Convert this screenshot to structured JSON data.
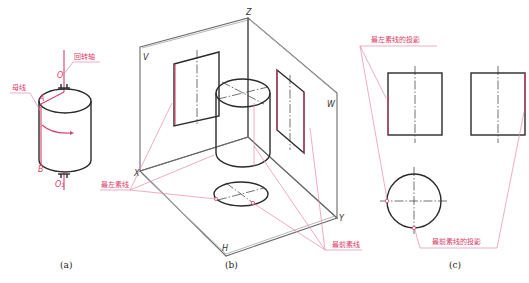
{
  "figure_a": {
    "caption": "(a)",
    "labels": {
      "rotation_axis": "回转轴",
      "generatrix": "母线"
    },
    "points": {
      "O_top": "O",
      "A": "A",
      "B": "B",
      "O1_bottom": "O₁"
    }
  },
  "figure_b": {
    "caption": "(b)",
    "axes": {
      "Z": "Z",
      "X": "X",
      "Y": "Y"
    },
    "planes": {
      "V": "V",
      "W": "W",
      "H": "H"
    },
    "labels": {
      "leftmost_element": "最左素线",
      "frontmost_element": "最前素线"
    }
  },
  "figure_c": {
    "caption": "(c)",
    "labels": {
      "leftmost_projection": "最左素线的投影",
      "frontmost_projection": "最前素线的投影"
    }
  },
  "colors": {
    "outline": "#2a2a2a",
    "highlight": "#d9406a",
    "plane": "#6a6a6a"
  }
}
